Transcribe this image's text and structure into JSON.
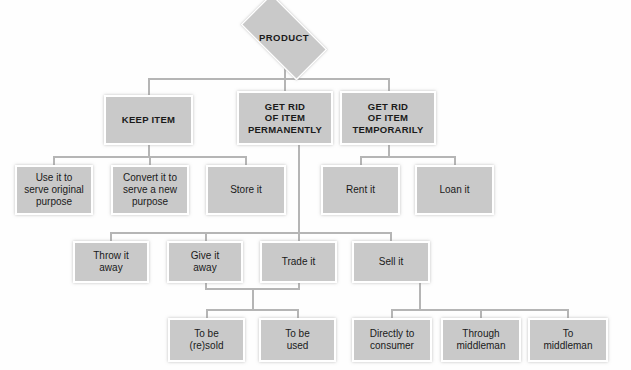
{
  "diagram": {
    "title": "PRODUCT",
    "type": "hierarchy-tree",
    "root": {
      "label": "PRODUCT",
      "shape": "diamond"
    },
    "level2": [
      {
        "id": "keep",
        "label": "KEEP ITEM"
      },
      {
        "id": "perm",
        "label": "GET RID\nOF ITEM\nPERMANENTLY",
        "lines": [
          "GET RID",
          "OF ITEM",
          "PERMANENTLY"
        ]
      },
      {
        "id": "temp",
        "label": "GET RID\nOF ITEM\nTEMPORARILY",
        "lines": [
          "GET RID",
          "OF ITEM",
          "TEMPORARILY"
        ]
      }
    ],
    "level3": [
      {
        "id": "use",
        "parent": "keep",
        "lines": [
          "Use it to",
          "serve original",
          "purpose"
        ]
      },
      {
        "id": "convert",
        "parent": "keep",
        "lines": [
          "Convert it to",
          "serve a new",
          "purpose"
        ]
      },
      {
        "id": "store",
        "parent": "keep",
        "lines": [
          "Store it"
        ]
      },
      {
        "id": "rent",
        "parent": "temp",
        "lines": [
          "Rent it"
        ]
      },
      {
        "id": "loan",
        "parent": "temp",
        "lines": [
          "Loan it"
        ]
      }
    ],
    "level4": [
      {
        "id": "throw",
        "parent": "perm",
        "lines": [
          "Throw it",
          "away"
        ]
      },
      {
        "id": "give",
        "parent": "perm",
        "lines": [
          "Give it",
          "away"
        ]
      },
      {
        "id": "trade",
        "parent": "perm",
        "lines": [
          "Trade it"
        ]
      },
      {
        "id": "sell",
        "parent": "perm",
        "lines": [
          "Sell it"
        ]
      }
    ],
    "level5": [
      {
        "id": "resold",
        "parent": "trade",
        "lines": [
          "To be",
          "(re)sold"
        ]
      },
      {
        "id": "used",
        "parent": "trade",
        "lines": [
          "To be",
          "used"
        ]
      },
      {
        "id": "direct",
        "parent": "sell",
        "lines": [
          "Directly to",
          "consumer"
        ]
      },
      {
        "id": "through",
        "parent": "sell",
        "lines": [
          "Through",
          "middleman"
        ]
      },
      {
        "id": "tomid",
        "parent": "sell",
        "lines": [
          "To",
          "middleman"
        ]
      }
    ],
    "colors": {
      "box_fill": "#c9c9c9",
      "box_border": "#ffffff",
      "connector": "#b5b5b5",
      "text": "#1a1a1a",
      "background": "#fefefe"
    }
  }
}
